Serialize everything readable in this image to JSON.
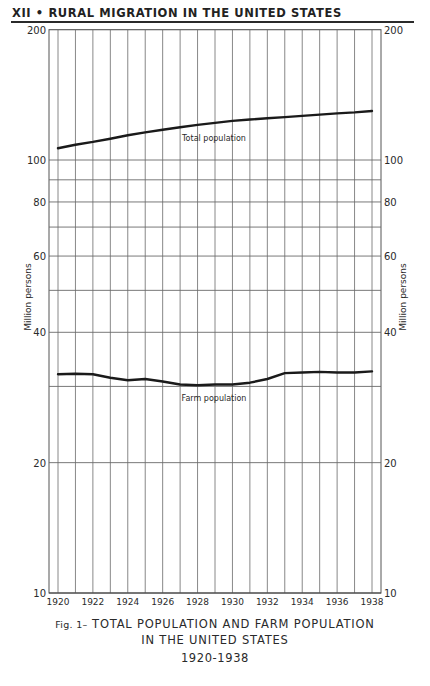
{
  "header": {
    "running_head": "XII • RURAL MIGRATION IN THE UNITED STATES"
  },
  "caption": {
    "fig_label": "Fig. 1–",
    "line1": "TOTAL  POPULATION AND FARM POPULATION",
    "line2": "IN THE UNITED STATES",
    "line3": "1920-1938"
  },
  "chart_data": {
    "type": "line",
    "xlabel": "",
    "ylabel": "Million persons",
    "y_scale": "log",
    "ylim": [
      10,
      200
    ],
    "xlim": [
      1920,
      1938
    ],
    "grid": true,
    "y_ticks": [
      10,
      20,
      40,
      60,
      80,
      100,
      200
    ],
    "y_tick_labels": [
      "10",
      "20",
      "40",
      "60",
      "80",
      "100",
      "200"
    ],
    "y_gridlines": [
      20,
      30,
      40,
      50,
      60,
      70,
      80,
      90,
      100,
      200
    ],
    "x_tick_labels": [
      "1920",
      "1922",
      "1924",
      "1926",
      "1928",
      "1930",
      "1932",
      "1934",
      "1936",
      "1938"
    ],
    "x": [
      1920,
      1921,
      1922,
      1923,
      1924,
      1925,
      1926,
      1927,
      1928,
      1929,
      1930,
      1931,
      1932,
      1933,
      1934,
      1935,
      1936,
      1937,
      1938
    ],
    "series": [
      {
        "name": "Total population",
        "values": [
          106.5,
          108.5,
          110.1,
          112.0,
          114.1,
          115.8,
          117.4,
          119.0,
          120.5,
          121.8,
          123.1,
          124.0,
          124.8,
          125.6,
          126.4,
          127.3,
          128.1,
          128.8,
          129.8
        ]
      },
      {
        "name": "Farm population",
        "values": [
          32.0,
          32.1,
          32.0,
          31.4,
          31.0,
          31.2,
          30.8,
          30.3,
          30.2,
          30.3,
          30.3,
          30.6,
          31.2,
          32.2,
          32.3,
          32.4,
          32.3,
          32.3,
          32.5
        ]
      }
    ],
    "annotations": [
      {
        "text": "Total population",
        "near_series": "Total population",
        "position": "below line, centered"
      },
      {
        "text": "Farm population",
        "near_series": "Farm population",
        "position": "below line, centered"
      }
    ],
    "legend": "none (direct labels)"
  }
}
